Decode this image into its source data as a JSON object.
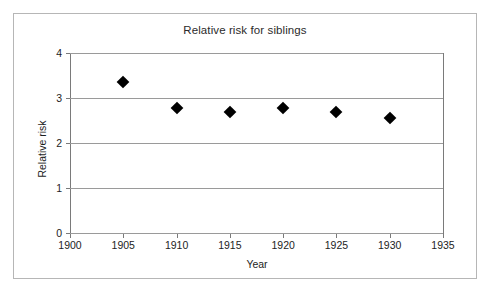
{
  "chart_data": {
    "type": "scatter",
    "title": "Relative risk for siblings",
    "xlabel": "Year",
    "ylabel": "Relative risk",
    "x": [
      1905,
      1910,
      1915,
      1920,
      1925,
      1930
    ],
    "values": [
      3.35,
      2.78,
      2.68,
      2.78,
      2.68,
      2.55
    ],
    "series": [
      {
        "name": "Relative risk for siblings",
        "values": [
          3.35,
          2.78,
          2.68,
          2.78,
          2.68,
          2.55
        ]
      }
    ],
    "xlim": [
      1900,
      1935
    ],
    "ylim": [
      0,
      4
    ],
    "xticks": [
      1900,
      1905,
      1910,
      1915,
      1920,
      1925,
      1930,
      1935
    ],
    "yticks": [
      0,
      1,
      2,
      3,
      4
    ],
    "xtick_labels": [
      "1900",
      "1905",
      "1910",
      "1915",
      "1920",
      "1925",
      "1930",
      "1935"
    ],
    "ytick_labels": [
      "0",
      "1",
      "2",
      "3",
      "4"
    ],
    "grid": "horizontal",
    "legend": "none",
    "marker": "diamond",
    "marker_color": "#000000",
    "gridline_color": "#9a9a9a",
    "axis_color": "#7a7a7a",
    "border_color": "#b6b6b6",
    "background_color": "#ffffff"
  }
}
